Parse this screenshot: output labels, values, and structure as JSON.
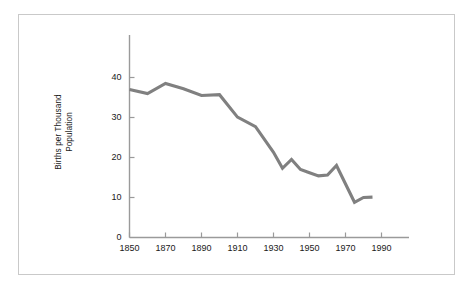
{
  "figure": {
    "background_color": "#ffffff",
    "frame_color": "#c9c9c9",
    "axis_color": "#9a9a9a",
    "text_color": "#1a1a1a"
  },
  "chart_data": {
    "type": "line",
    "title": "",
    "xlabel": "",
    "ylabel": "Births per Thousand Population",
    "ylabel_line1": "Births per Thousand",
    "ylabel_line2": "Population",
    "series_color": "#808080",
    "grid": false,
    "legend": false,
    "xlim": [
      1840,
      1995
    ],
    "ylim": [
      0,
      46
    ],
    "xticks": [
      1850,
      1870,
      1890,
      1910,
      1930,
      1950,
      1970,
      1990
    ],
    "xtick_labels": [
      "1850",
      "1870",
      "1890",
      "1910",
      "1930",
      "1950",
      "1970",
      "1990"
    ],
    "yticks": [
      0,
      10,
      20,
      30,
      40
    ],
    "ytick_labels": [
      "0",
      "10",
      "20",
      "30",
      "40"
    ],
    "series": [
      {
        "name": "Births per Thousand Population",
        "x": [
          1850,
          1860,
          1870,
          1880,
          1890,
          1900,
          1910,
          1920,
          1930,
          1935,
          1940,
          1945,
          1950,
          1955,
          1960,
          1965,
          1975,
          1980,
          1985
        ],
        "values": [
          37.0,
          36.0,
          38.5,
          37.2,
          35.5,
          35.7,
          30.1,
          27.7,
          21.3,
          17.3,
          19.5,
          17.0,
          16.2,
          15.4,
          15.6,
          18.0,
          8.8,
          10.0,
          10.1
        ]
      }
    ]
  }
}
